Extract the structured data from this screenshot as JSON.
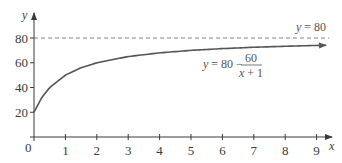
{
  "chart_data": {
    "type": "line",
    "title": "",
    "xlabel": "x",
    "ylabel": "y",
    "xlim": [
      0,
      9.5
    ],
    "ylim": [
      0,
      85
    ],
    "x_ticks": [
      1,
      2,
      3,
      4,
      5,
      6,
      7,
      8,
      9
    ],
    "y_ticks": [
      20,
      40,
      60,
      80
    ],
    "origin_label": "0",
    "grid": false,
    "legend": null,
    "series": [
      {
        "name": "y = 80 − 60/(x + 1)",
        "style": "solid",
        "arrow_end": true,
        "x": [
          0,
          0.25,
          0.5,
          1,
          1.5,
          2,
          3,
          4,
          5,
          6,
          7,
          8,
          9,
          9.3
        ],
        "values": [
          20,
          32,
          40,
          50,
          56,
          60,
          65,
          68,
          70,
          71.43,
          72.5,
          73.33,
          74,
          74.17
        ]
      },
      {
        "name": "y = 80",
        "style": "dashed",
        "x": [
          0,
          9.4
        ],
        "values": [
          80,
          80
        ]
      }
    ],
    "annotations": [
      {
        "text": "y = 80",
        "x": 8.6,
        "y": 84
      },
      {
        "text": "y = 80 − 60/(x + 1)",
        "x": 6.8,
        "y": 58
      }
    ]
  },
  "labels": {
    "x_axis": "x",
    "y_axis": "y",
    "origin": "0",
    "asymptote": {
      "var": "y",
      "eq": " = 80"
    },
    "curve": {
      "var": "y",
      "lhs": " = 80 −",
      "numerator": "60",
      "denominator_var": "x",
      "denominator_rest": " + 1"
    }
  },
  "colors": {
    "axis": "#3a3a3a",
    "curve": "#555555",
    "asymptote": "#777777",
    "text": "#3a3a3a"
  }
}
